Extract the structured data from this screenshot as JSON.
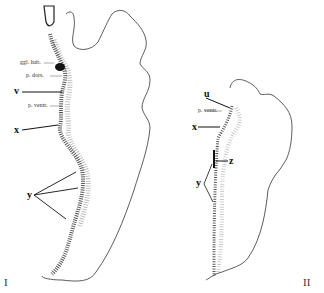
{
  "figure_I": {
    "numeral": "I",
    "labels": {
      "ggl_hab": "ggl. hab.",
      "p_dors": "p. dors.",
      "v": "v",
      "p_ventr": "p. ventr.",
      "x": "x",
      "y": "y"
    }
  },
  "figure_II": {
    "numeral": "II",
    "labels": {
      "u": "u",
      "p_ventr": "p. ventr.",
      "x": "x",
      "z": "z",
      "y": "y"
    }
  }
}
